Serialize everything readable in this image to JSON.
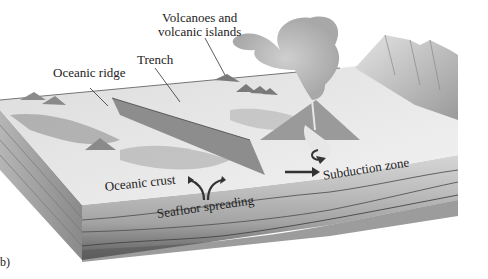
{
  "figure": {
    "panel_label": "b)",
    "labels": {
      "volcanoes_line1": "Volcanoes and",
      "volcanoes_line2": "volcanic islands",
      "trench": "Trench",
      "oceanic_ridge": "Oceanic ridge",
      "oceanic_crust": "Oceanic crust",
      "seafloor_spreading": "Seafloor spreading",
      "subduction_zone": "Subduction zone"
    },
    "colors": {
      "background": "#ffffff",
      "sea_surface": "#e9e9e9",
      "crust_light": "#cfcfcf",
      "mantle_mid": "#a9a9a9",
      "mantle_dark": "#6e6e6e",
      "text": "#222222"
    }
  }
}
